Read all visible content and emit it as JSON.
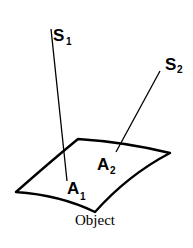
{
  "diagram": {
    "sources": [
      {
        "label": "S",
        "subscript": "1"
      },
      {
        "label": "S",
        "subscript": "2"
      }
    ],
    "points": [
      {
        "label": "A",
        "subscript": "1"
      },
      {
        "label": "A",
        "subscript": "2"
      }
    ],
    "caption": "Object",
    "colors": {
      "stroke": "#000000",
      "background": "#ffffff"
    }
  }
}
